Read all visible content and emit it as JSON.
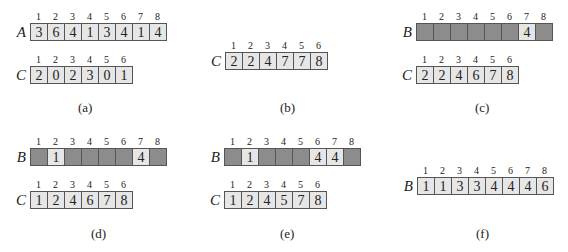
{
  "panels": [
    {
      "label": "(a)",
      "arrays": [
        {
          "name": "A",
          "indices": [
            "1",
            "2",
            "3",
            "4",
            "5",
            "6",
            "7",
            "8"
          ],
          "values": [
            "3",
            "6",
            "4",
            "1",
            "3",
            "4",
            "1",
            "4"
          ]
        },
        {
          "name": "C",
          "indices": [
            "1",
            "2",
            "3",
            "4",
            "5",
            "6"
          ],
          "values": [
            "2",
            "0",
            "2",
            "3",
            "0",
            "1"
          ]
        }
      ]
    },
    {
      "label": "(b)",
      "arrays": [
        {
          "name": "C",
          "indices": [
            "1",
            "2",
            "3",
            "4",
            "5",
            "6"
          ],
          "values": [
            "2",
            "2",
            "4",
            "7",
            "7",
            "8"
          ]
        }
      ]
    },
    {
      "label": "(c)",
      "arrays": [
        {
          "name": "B",
          "indices": [
            "1",
            "2",
            "3",
            "4",
            "5",
            "6",
            "7",
            "8"
          ],
          "values": [
            "",
            "",
            "",
            "",
            "",
            "",
            "4",
            ""
          ]
        },
        {
          "name": "C",
          "indices": [
            "1",
            "2",
            "3",
            "4",
            "5",
            "6"
          ],
          "values": [
            "2",
            "2",
            "4",
            "6",
            "7",
            "8"
          ]
        }
      ]
    },
    {
      "label": "(d)",
      "arrays": [
        {
          "name": "B",
          "indices": [
            "1",
            "2",
            "3",
            "4",
            "5",
            "6",
            "7",
            "8"
          ],
          "values": [
            "",
            "1",
            "",
            "",
            "",
            "",
            "4",
            ""
          ]
        },
        {
          "name": "C",
          "indices": [
            "1",
            "2",
            "3",
            "4",
            "5",
            "6"
          ],
          "values": [
            "1",
            "2",
            "4",
            "6",
            "7",
            "8"
          ]
        }
      ]
    },
    {
      "label": "(e)",
      "arrays": [
        {
          "name": "B",
          "indices": [
            "1",
            "2",
            "3",
            "4",
            "5",
            "6",
            "7",
            "8"
          ],
          "values": [
            "",
            "1",
            "",
            "",
            "",
            "4",
            "4",
            ""
          ]
        },
        {
          "name": "C",
          "indices": [
            "1",
            "2",
            "3",
            "4",
            "5",
            "6"
          ],
          "values": [
            "1",
            "2",
            "4",
            "5",
            "7",
            "8"
          ]
        }
      ]
    },
    {
      "label": "(f)",
      "arrays": [
        {
          "name": "B",
          "indices": [
            "1",
            "2",
            "3",
            "4",
            "5",
            "6",
            "7",
            "8"
          ],
          "values": [
            "1",
            "1",
            "3",
            "3",
            "4",
            "4",
            "4",
            "6"
          ]
        }
      ]
    }
  ],
  "colors": {
    "filled_cell": "#e6e6e6",
    "empty_cell": "#8c8c8c",
    "border": "#555555"
  }
}
